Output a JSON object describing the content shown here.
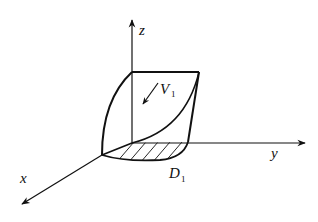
{
  "diagram": {
    "type": "3d-region-sketch",
    "axes": {
      "x": {
        "label": "x"
      },
      "y": {
        "label": "y"
      },
      "z": {
        "label": "z"
      }
    },
    "labels": {
      "volume": {
        "main": "V",
        "sub": "1"
      },
      "domain": {
        "main": "D",
        "sub": "1"
      }
    },
    "colors": {
      "stroke": "#111111",
      "background": "#ffffff"
    }
  }
}
